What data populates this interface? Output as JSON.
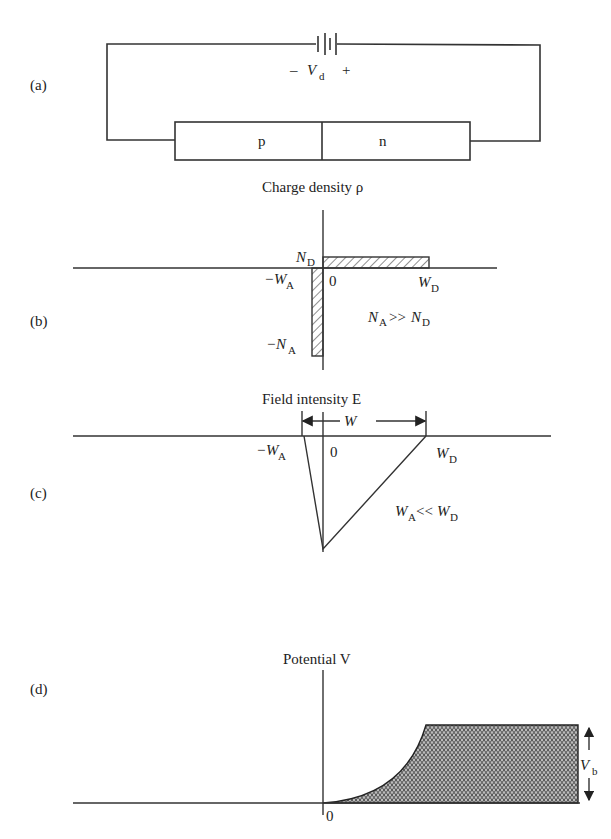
{
  "panels": {
    "a": {
      "label": "(a)",
      "battery_label": "V",
      "battery_sub": "d",
      "minus": "–",
      "plus": "+",
      "p_region": "p",
      "n_region": "n"
    },
    "b": {
      "label": "(b)",
      "title": "Charge density ρ",
      "nd": "N",
      "nd_sub": "D",
      "na": "−N",
      "na_sub": "A",
      "wa": "−W",
      "wa_sub": "A",
      "zero": "0",
      "wd": "W",
      "wd_sub": "D",
      "relation_left": "N",
      "relation_left_sub": "A",
      "relation_op": ">>",
      "relation_right": "N",
      "relation_right_sub": "D"
    },
    "c": {
      "label": "(c)",
      "title": "Field intensity E",
      "width_label": "W",
      "wa": "−W",
      "wa_sub": "A",
      "zero": "0",
      "wd": "W",
      "wd_sub": "D",
      "relation_left": "W",
      "relation_left_sub": "A",
      "relation_op": "<<",
      "relation_right": "W",
      "relation_right_sub": "D"
    },
    "d": {
      "label": "(d)",
      "title": "Potential V",
      "zero": "0",
      "vb": "V",
      "vb_sub": "b"
    }
  },
  "colors": {
    "line": "#333333",
    "text": "#222222",
    "hatch": "#444444"
  }
}
